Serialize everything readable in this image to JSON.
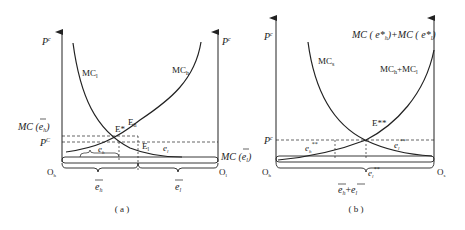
{
  "panel_a": {
    "caption": "( a )",
    "left_axis_label": "P",
    "left_axis_sup": "c",
    "right_axis_label": "P",
    "right_axis_sup": "c",
    "curve_left": "MC",
    "curve_left_sub": "l",
    "curve_right": "MC",
    "curve_right_sub": "h",
    "mc_eh_label": "MC (",
    "mc_eh_var": "e",
    "mc_eh_sub": "h",
    "mc_eh_close": ")",
    "pc_label": "P",
    "pc_sup": "C",
    "e_star": "E*",
    "e_h": "E",
    "e_h_sub": "h",
    "e_l": "E",
    "e_l_sub": "l",
    "eh_star": "e",
    "eh_star_sub": "h",
    "el_star": "e",
    "el_star_sub": "l",
    "origin_left": "O",
    "origin_left_sub": "h",
    "origin_right": "O",
    "origin_right_sub": "l",
    "mc_el_label": "MC (",
    "mc_el_var": "e",
    "mc_el_sub": "l",
    "mc_el_close": ")",
    "brace_left_var": "e",
    "brace_left_sub": "h",
    "brace_right_var": "e",
    "brace_right_sub": "l"
  },
  "panel_b": {
    "caption": "( b )",
    "axis_label": "P",
    "axis_sup": "c",
    "curve_left": "MC",
    "curve_left_sub": "s",
    "curve_sum": "MC",
    "curve_sum_sub1": "h",
    "curve_sum_plus": "+MC",
    "curve_sum_sub2": "l",
    "top_right_label": "MC ( e*",
    "top_right_sub1": "h",
    "top_right_mid": ")+MC ( e*",
    "top_right_sub2": "l",
    "top_right_close": ")",
    "pc_label": "P",
    "pc_sup": "c",
    "e_star2": "E**",
    "eh_star2": "e",
    "eh_star2_sub": "h",
    "eh_star2_sup": "**",
    "el_star2": "e",
    "el_star2_sub": "l",
    "el_star2_sup": "**",
    "el_bottom": "e",
    "el_bottom_sub": "l",
    "el_bottom_sup": "**",
    "origin_left": "O",
    "origin_left_sub": "h",
    "origin_right": "O",
    "origin_right_sub": "s",
    "brace_sum_var1": "e",
    "brace_sum_sub1": "h",
    "brace_sum_plus": "+",
    "brace_sum_var2": "e",
    "brace_sum_sub2": "l"
  }
}
